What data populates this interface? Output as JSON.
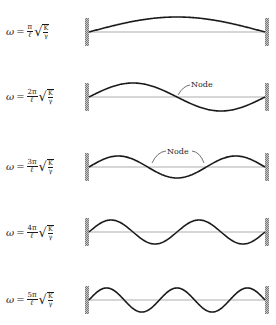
{
  "modes": [
    {
      "n": 1,
      "formula": {
        "omega": "ω",
        "eq": "=",
        "numerator": "π",
        "denominator": "ℓ",
        "radicand_num": "K",
        "radicand_den": "γ"
      },
      "string_y": 32,
      "amplitude": 15,
      "half_waves": 1,
      "node_labels": []
    },
    {
      "n": 2,
      "formula": {
        "omega": "ω",
        "eq": "=",
        "numerator": "2π",
        "denominator": "ℓ",
        "radicand_num": "K",
        "radicand_den": "γ"
      },
      "string_y": 97,
      "amplitude": 14,
      "half_waves": 2,
      "node_labels": [
        {
          "text": "Node",
          "x": 191,
          "y": 80
        }
      ]
    },
    {
      "n": 3,
      "formula": {
        "omega": "ω",
        "eq": "=",
        "numerator": "3π",
        "denominator": "ℓ",
        "radicand_num": "K",
        "radicand_den": "γ"
      },
      "string_y": 167,
      "amplitude": 11,
      "half_waves": 3,
      "node_labels": [
        {
          "text": "Node",
          "x": 167,
          "y": 147
        }
      ]
    },
    {
      "n": 4,
      "formula": {
        "omega": "ω",
        "eq": "=",
        "numerator": "4π",
        "denominator": "ℓ",
        "radicand_num": "K",
        "radicand_den": "γ"
      },
      "string_y": 232,
      "amplitude": 12,
      "half_waves": 4,
      "node_labels": []
    },
    {
      "n": 5,
      "formula": {
        "omega": "ω",
        "eq": "=",
        "numerator": "5π",
        "denominator": "ℓ",
        "radicand_num": "K",
        "radicand_den": "γ"
      },
      "string_y": 300,
      "amplitude": 12,
      "half_waves": 5,
      "node_labels": []
    }
  ],
  "geometry": {
    "left_wall_x": 89,
    "right_wall_x": 265,
    "wall_half_height": 14
  },
  "colors": {
    "string": "#1a1a1a",
    "baseline": "#8a8a8a",
    "wall": "#9a9a9a"
  },
  "node_label_text": "Node"
}
